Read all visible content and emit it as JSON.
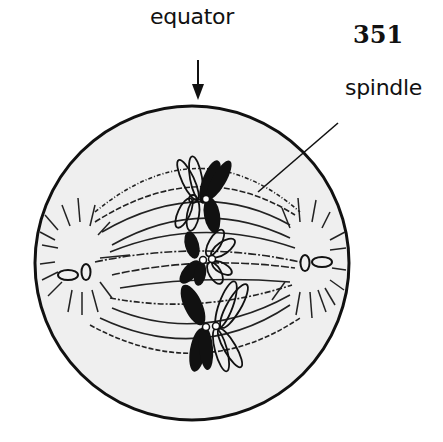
{
  "figure": {
    "number": "351",
    "labels": {
      "equator": "equator",
      "spindle": "spindle"
    },
    "colors": {
      "cell_fill": "#efefef",
      "ink": "#111111",
      "background": "#ffffff"
    }
  }
}
